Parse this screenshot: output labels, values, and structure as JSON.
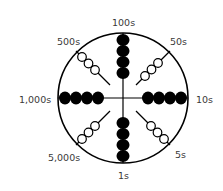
{
  "diagram": {
    "title": "",
    "type": "abacus-wheel",
    "colors": {
      "stroke": "#000000",
      "bead_filled": "#000000",
      "bead_open": "#ffffff",
      "label": "#3a3a3a"
    },
    "labels": {
      "top": "100s",
      "top_right": "50s",
      "right": "10s",
      "bottom_right": "5s",
      "bottom": "1s",
      "bottom_left": "5,000s",
      "left": "1,000s",
      "top_left": "500s"
    },
    "spokes": [
      {
        "direction": "top",
        "label": "100s",
        "beads": 4,
        "bead_style": "filled"
      },
      {
        "direction": "top-right",
        "label": "50s",
        "beads": 3,
        "bead_style": "open"
      },
      {
        "direction": "right",
        "label": "10s",
        "beads": 4,
        "bead_style": "filled"
      },
      {
        "direction": "bottom-right",
        "label": "5s",
        "beads": 3,
        "bead_style": "open"
      },
      {
        "direction": "bottom",
        "label": "1s",
        "beads": 4,
        "bead_style": "filled"
      },
      {
        "direction": "bottom-left",
        "label": "5,000s",
        "beads": 3,
        "bead_style": "open"
      },
      {
        "direction": "left",
        "label": "1,000s",
        "beads": 4,
        "bead_style": "filled"
      },
      {
        "direction": "top-left",
        "label": "500s",
        "beads": 3,
        "bead_style": "open"
      }
    ]
  }
}
